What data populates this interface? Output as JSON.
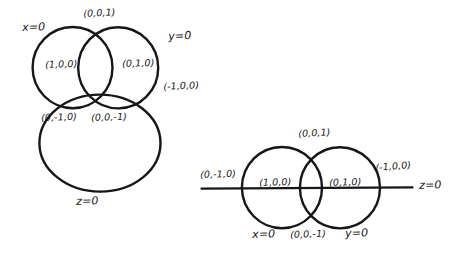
{
  "figure": {
    "ink_color": "#161616",
    "background_color": "#ffffff"
  },
  "left_diagram": {
    "name": "three-circle-venn",
    "plane_labels": [
      {
        "id": "x-plane",
        "text": "x=0"
      },
      {
        "id": "y-plane",
        "text": "y=0"
      },
      {
        "id": "z-plane",
        "text": "z=0"
      }
    ],
    "point_labels": [
      {
        "id": "pt-001",
        "text": "(0,0,1)"
      },
      {
        "id": "pt-100",
        "text": "(1,0,0)"
      },
      {
        "id": "pt-010",
        "text": "(0,1,0)"
      },
      {
        "id": "pt-m100",
        "text": "(-1,0,0)"
      },
      {
        "id": "pt-0m10",
        "text": "(0,-1,0)"
      },
      {
        "id": "pt-00m1",
        "text": "(0,0,-1)"
      }
    ]
  },
  "right_diagram": {
    "name": "two-circle-with-axis",
    "plane_labels": [
      {
        "id": "x-plane",
        "text": "x=0"
      },
      {
        "id": "y-plane",
        "text": "y=0"
      },
      {
        "id": "z-plane",
        "text": "z=0"
      }
    ],
    "point_labels": [
      {
        "id": "pt-001",
        "text": "(0,0,1)"
      },
      {
        "id": "pt-0m10",
        "text": "(0,-1,0)"
      },
      {
        "id": "pt-100",
        "text": "(1,0,0)"
      },
      {
        "id": "pt-010",
        "text": "(0,1,0)"
      },
      {
        "id": "pt-m100",
        "text": "(-1,0,0)"
      },
      {
        "id": "pt-00m1",
        "text": "(0,0,-1)"
      }
    ]
  }
}
